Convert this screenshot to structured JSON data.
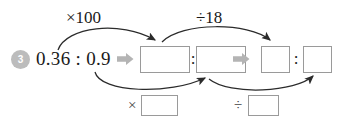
{
  "problem": {
    "number": "3",
    "expression": "0.36 : 0.9"
  },
  "operations": {
    "top_left_label": "×100",
    "top_right_label": "÷18",
    "bottom_left_sign": "×",
    "bottom_right_sign": "÷"
  },
  "separators": {
    "ratio_colon_1": ":",
    "ratio_colon_2": ":"
  },
  "answer_boxes": {
    "row_first_term": "",
    "row_second_term": "",
    "row_third_term": "",
    "row_fourth_term": "",
    "bottom_left_value": "",
    "bottom_right_value": ""
  },
  "icons": {
    "step_arrow_1": "fat-right-arrow-icon",
    "step_arrow_2": "fat-right-arrow-icon"
  },
  "colors": {
    "badge_fill": "#bcbcbc",
    "box_border": "#9a9a9a",
    "fat_arrow": "#b4b4b4",
    "curve_stroke": "#333333",
    "text": "#1a1a1a"
  }
}
